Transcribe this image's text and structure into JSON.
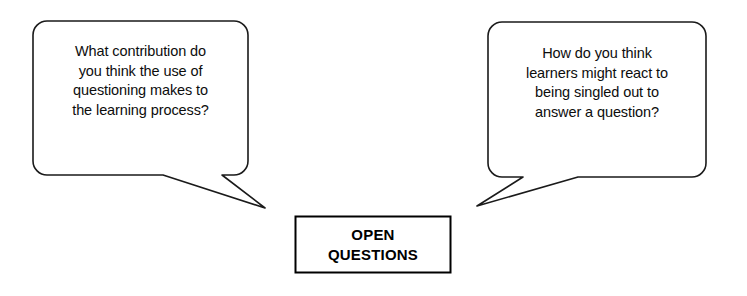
{
  "diagram": {
    "title": "Open Questions",
    "background_color": "#ffffff",
    "stroke_color": "#1a1a1a",
    "text_color": "#0d0d0d",
    "center_node": {
      "label": "OPEN\nQUESTIONS",
      "label_line_1": "OPEN",
      "label_line_2": "QUESTIONS",
      "shape": "rectangle",
      "border_color": "#000000",
      "fill_color": "#ffffff"
    },
    "callouts": [
      {
        "id": "left-callout",
        "shape": "rounded-rectangle-speech-bubble",
        "tail_direction": "bottom-right",
        "text": "What contribution do\nyou think the use of\nquestioning makes to\nthe learning process?",
        "lines": [
          "What contribution do",
          "you think the use of",
          "questioning makes to",
          "the learning process?"
        ]
      },
      {
        "id": "right-callout",
        "shape": "rounded-rectangle-speech-bubble",
        "tail_direction": "bottom-left",
        "text": "How do you think\nlearners might react to\nbeing singled out to\nanswer a question?",
        "lines": [
          "How do you think",
          "learners might react to",
          "being singled out to",
          "answer a question?"
        ]
      }
    ]
  }
}
